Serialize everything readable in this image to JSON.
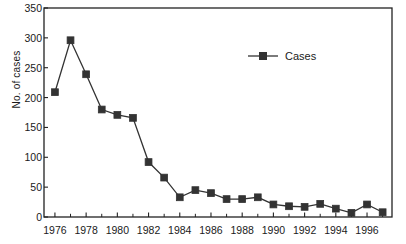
{
  "chart_data": {
    "type": "line",
    "title": "",
    "subtitle": "",
    "xlabel": "",
    "ylabel": "No. of cases",
    "xlim": [
      1975.3,
      1997.6
    ],
    "ylim": [
      0,
      350
    ],
    "grid": false,
    "legend_position": "inside-upper-right",
    "marker": "square",
    "marker_color": "#333333",
    "line_color": "#333333",
    "x_tick_labels": [
      "1976",
      "1978",
      "1980",
      "1982",
      "1984",
      "1986",
      "1988",
      "1990",
      "1992",
      "1994",
      "1996"
    ],
    "x_tick_values": [
      1976,
      1978,
      1980,
      1982,
      1984,
      1986,
      1988,
      1990,
      1992,
      1994,
      1996
    ],
    "x_minor_tick_values": [
      1977,
      1979,
      1981,
      1983,
      1985,
      1987,
      1989,
      1991,
      1993,
      1995,
      1997
    ],
    "y_tick_labels": [
      "0",
      "50",
      "100",
      "150",
      "200",
      "250",
      "300",
      "350"
    ],
    "y_tick_values": [
      0,
      50,
      100,
      150,
      200,
      250,
      300,
      350
    ],
    "series": [
      {
        "name": "Cases",
        "x": [
          1976,
          1977,
          1978,
          1979,
          1980,
          1981,
          1982,
          1983,
          1984,
          1985,
          1986,
          1987,
          1988,
          1989,
          1990,
          1991,
          1992,
          1993,
          1994,
          1995,
          1996,
          1997
        ],
        "values": [
          209,
          296,
          239,
          180,
          171,
          166,
          92,
          66,
          33,
          45,
          40,
          30,
          30,
          33,
          21,
          18,
          17,
          22,
          14,
          7,
          21,
          8
        ]
      }
    ],
    "legend": [
      "Cases"
    ],
    "annotations": []
  },
  "legend": {
    "label": "Cases"
  },
  "axes": {
    "y_title": "No. of cases"
  }
}
